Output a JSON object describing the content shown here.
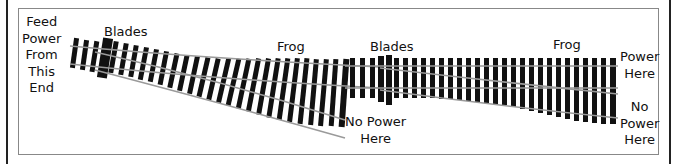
{
  "diagram": {
    "labels": {
      "feed": [
        "Feed",
        "Power",
        "From",
        "This",
        "End"
      ],
      "blades_1": "Blades",
      "frog_1": "Frog",
      "blades_2": "Blades",
      "frog_2": "Frog",
      "no_power_1": [
        "No Power",
        "Here"
      ],
      "power_here": [
        "Power",
        "Here"
      ],
      "no_power_2": [
        "No",
        "Power",
        "Here"
      ]
    },
    "colors": {
      "ties": "#111111",
      "rails": "#9a9a9a",
      "frame_border": "#888888",
      "outer_lines": "#222222"
    }
  }
}
